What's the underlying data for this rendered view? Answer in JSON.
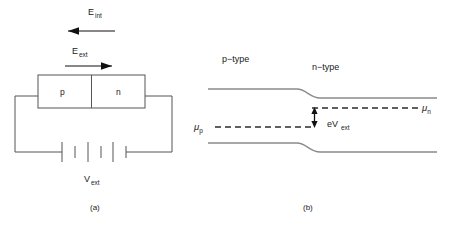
{
  "figure": {
    "panel_a": {
      "caption": "(a)",
      "field_internal": {
        "symbol": "E",
        "subscript": "int",
        "direction": "left"
      },
      "field_external": {
        "symbol": "E",
        "subscript": "ext",
        "direction": "right"
      },
      "junction": {
        "p_region_label": "p",
        "n_region_label": "n"
      },
      "battery": {
        "symbol": "V",
        "subscript": "ext",
        "cells": 3
      }
    },
    "panel_b": {
      "caption": "(b)",
      "region_left_label": "p−type",
      "region_right_label": "n−type",
      "mu_p": {
        "symbol": "μ",
        "subscript": "p"
      },
      "mu_n": {
        "symbol": "μ",
        "subscript": "n"
      },
      "energy_gap": {
        "symbol": "eV",
        "subscript": "ext"
      }
    }
  },
  "colors": {
    "background": "#ffffff",
    "circuit_line": "#555555",
    "band_line": "#8a8a8a",
    "dashed_line": "#2b2b2b",
    "arrow": "#111111",
    "text": "#1a1a1a"
  }
}
